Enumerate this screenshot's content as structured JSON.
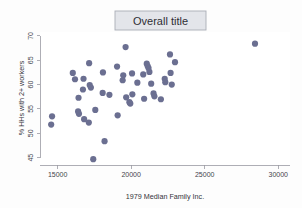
{
  "figure": {
    "title": "Overall title",
    "background_color": "#fdfdfd",
    "plot_background_color": "#ffffff",
    "marker_color": "#6b6f91",
    "axis_color": "#9a9aa2",
    "title_box_fill": "#e3e5ea",
    "title_box_border": "#a9adb6"
  },
  "chart_data": {
    "type": "scatter",
    "title": "Overall title",
    "xlabel": "1979 Median Family Inc.",
    "ylabel": "% HHs with 2+ workers",
    "xlim": [
      13800,
      30800
    ],
    "ylim": [
      43.5,
      70.8
    ],
    "xticks": [
      15000,
      20000,
      25000,
      30000
    ],
    "xtick_labels": [
      "15000",
      "20000",
      "25000",
      "30000"
    ],
    "yticks": [
      45,
      50,
      55,
      60,
      65,
      70
    ],
    "ytick_labels": [
      "45",
      "50",
      "55",
      "60",
      "65",
      "70"
    ],
    "grid": false,
    "legend": false,
    "marker_size": 3.1,
    "series": [
      {
        "name": "states",
        "color": "#6b6f91",
        "points": [
          [
            14620,
            53.5
          ],
          [
            14560,
            51.8
          ],
          [
            16030,
            62.4
          ],
          [
            16180,
            61.1
          ],
          [
            16420,
            57.3
          ],
          [
            16390,
            54.5
          ],
          [
            16450,
            54.0
          ],
          [
            16760,
            61.2
          ],
          [
            16720,
            59.0
          ],
          [
            16800,
            52.9
          ],
          [
            17140,
            64.4
          ],
          [
            17180,
            59.9
          ],
          [
            17260,
            59.4
          ],
          [
            17120,
            52.2
          ],
          [
            17420,
            44.7
          ],
          [
            17560,
            54.8
          ],
          [
            18080,
            62.5
          ],
          [
            18060,
            58.3
          ],
          [
            18190,
            48.4
          ],
          [
            18520,
            57.9
          ],
          [
            19040,
            63.7
          ],
          [
            19080,
            53.7
          ],
          [
            19460,
            61.9
          ],
          [
            19420,
            60.9
          ],
          [
            19620,
            67.7
          ],
          [
            19660,
            57.4
          ],
          [
            19880,
            56.4
          ],
          [
            19940,
            56.1
          ],
          [
            20060,
            62.3
          ],
          [
            20080,
            58.0
          ],
          [
            20420,
            60.4
          ],
          [
            20820,
            62.1
          ],
          [
            20880,
            57.1
          ],
          [
            21060,
            64.3
          ],
          [
            21120,
            63.8
          ],
          [
            21180,
            63.4
          ],
          [
            21240,
            62.6
          ],
          [
            21360,
            60.2
          ],
          [
            21520,
            58.2
          ],
          [
            21580,
            57.6
          ],
          [
            22020,
            57.0
          ],
          [
            22280,
            61.2
          ],
          [
            22320,
            60.5
          ],
          [
            22640,
            66.2
          ],
          [
            22680,
            62.4
          ],
          [
            22760,
            60.0
          ],
          [
            22980,
            64.6
          ],
          [
            28420,
            68.4
          ]
        ]
      }
    ]
  }
}
